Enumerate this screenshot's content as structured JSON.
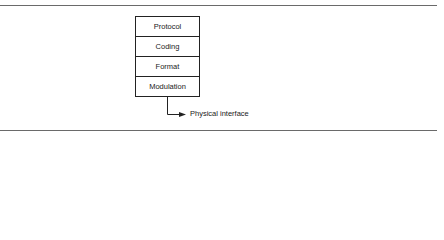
{
  "diagram": {
    "layers": [
      {
        "label": "Protocol"
      },
      {
        "label": "Coding"
      },
      {
        "label": "Format"
      },
      {
        "label": "Modulation"
      }
    ],
    "output_label": "Physical interface"
  }
}
